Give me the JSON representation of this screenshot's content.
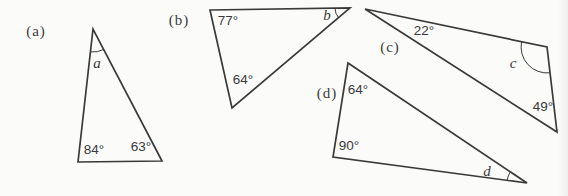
{
  "colors": {
    "ink": "#3a3a3a",
    "paper": "#fbfbf9"
  },
  "parts": {
    "a": {
      "label": "(a)",
      "unknown": "a",
      "angle1": "84°",
      "angle2": "63°"
    },
    "b": {
      "label": "(b)",
      "unknown": "b",
      "angle1": "77°",
      "angle2": "64°"
    },
    "c": {
      "label": "(c)",
      "unknown": "c",
      "angle1": "22°",
      "angle2": "49°"
    },
    "d": {
      "label": "(d)",
      "unknown": "d",
      "angle1": "64°",
      "angle2": "90°"
    }
  }
}
